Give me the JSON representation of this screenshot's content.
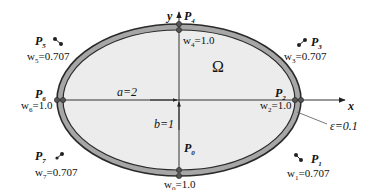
{
  "figure": {
    "domain_symbol": "Ω",
    "axes": {
      "x_label": "x",
      "y_label": "y"
    },
    "dimensions": {
      "a_label": "a=2",
      "b_label": "b=1",
      "epsilon_label": "ε=0.1"
    },
    "colors": {
      "background": "#ffffff",
      "interior_fill": "#ececec",
      "band_fill": "#a6a6a6",
      "outline": "#2a2a2a",
      "axis": "#333333",
      "control_point": "#222222"
    },
    "control_points": [
      {
        "id": "P0",
        "name": "P",
        "sub": "0",
        "weight_label": "w",
        "weight_sub": "0",
        "weight_value": "=1.0"
      },
      {
        "id": "P1",
        "name": "P",
        "sub": "1",
        "weight_label": "w",
        "weight_sub": "1",
        "weight_value": "=0.707"
      },
      {
        "id": "P2",
        "name": "P",
        "sub": "2",
        "weight_label": "w",
        "weight_sub": "2",
        "weight_value": "=1.0"
      },
      {
        "id": "P3",
        "name": "P",
        "sub": "3",
        "weight_label": "w",
        "weight_sub": "3",
        "weight_value": "=0.707"
      },
      {
        "id": "P4",
        "name": "P",
        "sub": "4",
        "weight_label": "w",
        "weight_sub": "4",
        "weight_value": "=1.0"
      },
      {
        "id": "P5",
        "name": "P",
        "sub": "5",
        "weight_label": "w",
        "weight_sub": "5",
        "weight_value": "=0.707"
      },
      {
        "id": "P6",
        "name": "P",
        "sub": "6",
        "weight_label": "w",
        "weight_sub": "6",
        "weight_value": "=1.0"
      },
      {
        "id": "P7",
        "name": "P",
        "sub": "7",
        "weight_label": "w",
        "weight_sub": "7",
        "weight_value": "=0.707"
      }
    ]
  }
}
